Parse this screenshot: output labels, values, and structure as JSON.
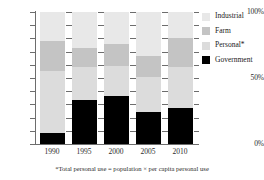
{
  "chart_data": {
    "type": "bar",
    "subtype": "stacked-percentage",
    "title": "",
    "xlabel": "",
    "ylabel": "",
    "ylim": [
      0,
      100
    ],
    "ytick_labels": [
      "100%",
      "50%",
      "0%"
    ],
    "ytick_values": [
      100,
      50,
      0
    ],
    "minor_ticks": [
      90,
      80,
      70,
      60,
      40,
      30,
      20,
      10
    ],
    "grid": false,
    "legend_position": "right",
    "categories": [
      "1990",
      "1995",
      "2000",
      "2005",
      "2010"
    ],
    "series": [
      {
        "name": "Government",
        "color": "#000000",
        "values": [
          8,
          33,
          36,
          24,
          27
        ]
      },
      {
        "name": "Personal*",
        "color": "#dcdcdc",
        "values": [
          47,
          25,
          23,
          27,
          31
        ]
      },
      {
        "name": "Farm",
        "color": "#c4c4c4",
        "values": [
          23,
          15,
          17,
          16,
          22
        ]
      },
      {
        "name": "Industrial",
        "color": "#e8e8e8",
        "values": [
          22,
          27,
          24,
          33,
          20
        ]
      }
    ],
    "stack_order_bottom_to_top": [
      "Government",
      "Personal*",
      "Farm",
      "Industrial"
    ],
    "annotations": [
      "*Total personal use = population × per capita personal use"
    ]
  },
  "legend": {
    "items": [
      {
        "label": "Industrial",
        "color": "#e8e8e8"
      },
      {
        "label": "Farm",
        "color": "#c4c4c4"
      },
      {
        "label": "Personal*",
        "color": "#dcdcdc"
      },
      {
        "label": "Government",
        "color": "#000000"
      }
    ]
  },
  "axis": {
    "y_labels": [
      "100%",
      "50%",
      "0%"
    ],
    "x_labels": [
      "1990",
      "1995",
      "2000",
      "2005",
      "2010"
    ]
  },
  "footnote": {
    "text": "*Total personal use = population × per capita personal use"
  },
  "colors": {
    "industrial": "#e8e8e8",
    "farm": "#c4c4c4",
    "personal": "#dcdcdc",
    "government": "#000000",
    "axis": "#6d6d6d",
    "text": "#1a1a1a",
    "background": "#ffffff"
  }
}
